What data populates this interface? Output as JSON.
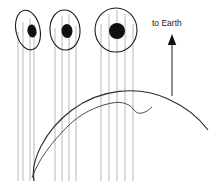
{
  "figure": {
    "title": "",
    "type": "schematic-diagram",
    "background_color": "#ffffff",
    "width": 217,
    "height": 181
  },
  "annotations": {
    "direction_label": "to Earth",
    "direction_arrow": "up-arrow-icon"
  },
  "colors": {
    "outline": "#1a1a1a",
    "ray_line": "#9a9a9a",
    "pupil_fill": "#111111",
    "limb_curve": "#2b2b2b",
    "wave_curve": "#3a3a3a"
  },
  "objects": [
    {
      "id": "source-1",
      "name": "ellipse-source-left",
      "shape": "ellipse",
      "cx": 28,
      "cy": 30,
      "rx": 12,
      "ry": 20,
      "rotation_deg": -12,
      "pupil": {
        "cx": 32,
        "cy": 31,
        "rx": 4.5,
        "ry": 6.5,
        "rotation_deg": -12
      },
      "ray_x": [
        18,
        23,
        30,
        34
      ],
      "ray_bottom": 181
    },
    {
      "id": "source-2",
      "name": "ellipse-source-middle",
      "shape": "ellipse",
      "cx": 65,
      "cy": 30,
      "rx": 15,
      "ry": 20,
      "rotation_deg": -4,
      "pupil": {
        "cx": 67,
        "cy": 31,
        "rx": 5.5,
        "ry": 7,
        "rotation_deg": -4
      },
      "ray_x": [
        55,
        62,
        69,
        76
      ],
      "ray_bottom": 181
    },
    {
      "id": "source-3",
      "name": "circle-source-right",
      "shape": "circle",
      "cx": 116,
      "cy": 30,
      "rx": 21,
      "ry": 22,
      "rotation_deg": 0,
      "pupil": {
        "cx": 117,
        "cy": 31,
        "rx": 8,
        "ry": 8,
        "rotation_deg": 0
      },
      "ray_x": [
        101,
        109,
        117,
        125,
        133
      ],
      "ray_bottom": 181
    }
  ],
  "curves": {
    "earth_limb": {
      "name": "earth-limb-curve",
      "path": "M 34 181 C 30 162 44 131 72 110 C 100 89 138 85 168 99 C 186 107 199 118 208 130"
    },
    "wave_curve": {
      "name": "refracted-wave-curve",
      "path": "M 32 178 C 38 160 52 142 68 126 C 80 114 96 106 112 103 C 122 101 130 104 134 110 C 138 116 146 113 152 107"
    }
  },
  "arrow": {
    "name": "to-earth-arrow",
    "x": 172,
    "tip_y": 35,
    "tail_y": 96,
    "head_width": 7,
    "head_height": 10
  },
  "label_position": {
    "x": 152,
    "y": 26
  }
}
